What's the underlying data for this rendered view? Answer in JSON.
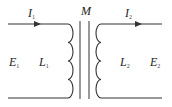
{
  "diagram": {
    "type": "transformer-circuit",
    "colors": {
      "line": "#333333",
      "background": "#ffffff"
    },
    "labels": {
      "mutual_inductance": "M",
      "primary_current": {
        "symbol": "I",
        "subscript": "1"
      },
      "secondary_current": {
        "symbol": "I",
        "subscript": "2"
      },
      "primary_emf": {
        "symbol": "E",
        "subscript": "1"
      },
      "secondary_emf": {
        "symbol": "E",
        "subscript": "2"
      },
      "primary_inductance": {
        "symbol": "L",
        "subscript": "1"
      },
      "secondary_inductance": {
        "symbol": "L",
        "subscript": "2"
      }
    }
  }
}
